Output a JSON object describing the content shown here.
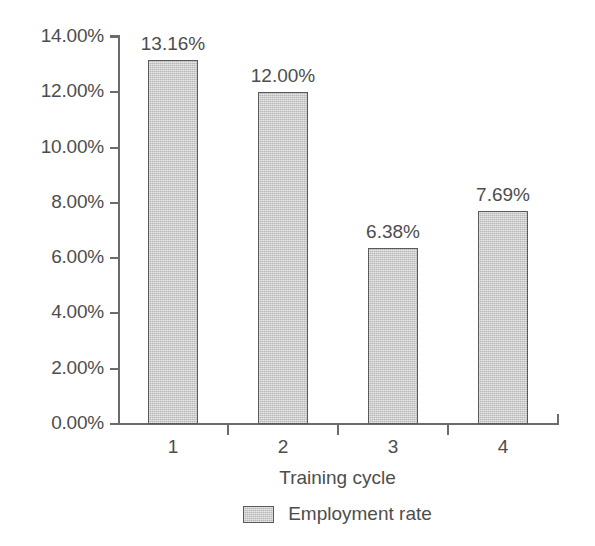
{
  "chart_data": {
    "type": "bar",
    "title": "",
    "subtitle": "",
    "xlabel": "Training cycle",
    "ylabel": "",
    "categories": [
      "1",
      "2",
      "3",
      "4"
    ],
    "values": [
      13.16,
      12.0,
      6.38,
      7.69
    ],
    "value_labels": [
      "13.16%",
      "12.00%",
      "6.38%",
      "7.69%"
    ],
    "series": [
      {
        "name": "Employment rate",
        "values": [
          13.16,
          12.0,
          6.38,
          7.69
        ]
      }
    ],
    "ylim": [
      0,
      14
    ],
    "ytick_values": [
      0,
      2,
      4,
      6,
      8,
      10,
      12,
      14
    ],
    "ytick_labels": [
      "0.00%",
      "2.00%",
      "4.00%",
      "6.00%",
      "8.00%",
      "10.00%",
      "12.00%",
      "14.00%"
    ],
    "grid": false,
    "legend": {
      "position": "bottom",
      "entries": [
        "Employment rate"
      ]
    },
    "colors": {
      "bar_fill": "#c9c9c9",
      "bar_border": "#5a5a5a",
      "axis": "#6b6b6b",
      "text": "#4d4d4d",
      "background": "#ffffff"
    }
  },
  "axis": {
    "x_title": "Training cycle"
  },
  "legend": {
    "entry_label": "Employment rate"
  }
}
